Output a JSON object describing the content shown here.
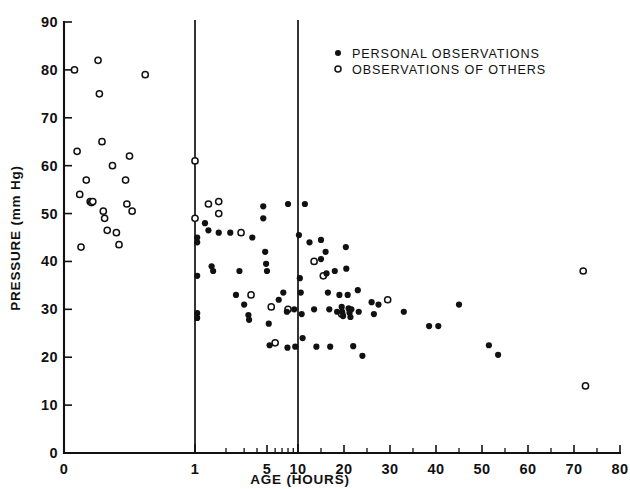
{
  "chart_data": {
    "type": "scatter",
    "title": "",
    "xlabel": "AGE (HOURS)",
    "ylabel": "PRESSURE (mm Hg)",
    "xlim": [
      0,
      80
    ],
    "ylim": [
      0,
      90
    ],
    "grid": false,
    "x_scale": "piecewise (0-1 linear expanded, 1-10 log, 10-80 linear)",
    "xticks": [
      0,
      1,
      5,
      10,
      20,
      30,
      40,
      50,
      60,
      70,
      80
    ],
    "xtick_labels": [
      "0",
      "1",
      "5",
      "10",
      "20",
      "30",
      "40",
      "50",
      "60",
      "70",
      "80"
    ],
    "yticks": [
      0,
      10,
      20,
      30,
      40,
      50,
      60,
      70,
      80,
      90
    ],
    "ytick_labels": [
      "0",
      "10",
      "20",
      "30",
      "40",
      "50",
      "60",
      "70",
      "80",
      "90"
    ],
    "vertical_reference_lines": [
      1,
      10
    ],
    "legend": {
      "position": "top-right",
      "entries": [
        {
          "label": "PERSONAL OBSERVATIONS",
          "marker": "filled-circle"
        },
        {
          "label": "OBSERVATIONS OF OTHERS",
          "marker": "open-circle"
        }
      ]
    },
    "series": [
      {
        "name": "PERSONAL OBSERVATIONS",
        "marker": "filled-circle",
        "color": "#111111",
        "points": [
          [
            1.05,
            45.0
          ],
          [
            1.05,
            44.0
          ],
          [
            1.05,
            37.0
          ],
          [
            1.05,
            29.2
          ],
          [
            1.05,
            28.2
          ],
          [
            1.25,
            48.0
          ],
          [
            1.35,
            46.5
          ],
          [
            1.45,
            39.0
          ],
          [
            1.5,
            38.0
          ],
          [
            1.7,
            46.0
          ],
          [
            2.2,
            46.0
          ],
          [
            2.5,
            33.0
          ],
          [
            2.7,
            38.0
          ],
          [
            3.0,
            31.0
          ],
          [
            3.3,
            28.8
          ],
          [
            3.35,
            27.8
          ],
          [
            3.6,
            45.0
          ],
          [
            4.6,
            51.5
          ],
          [
            4.6,
            49.0
          ],
          [
            4.8,
            42.0
          ],
          [
            4.9,
            39.5
          ],
          [
            5.0,
            38.0
          ],
          [
            5.2,
            27.0
          ],
          [
            5.3,
            22.5
          ],
          [
            6.5,
            32.0
          ],
          [
            7.2,
            33.5
          ],
          [
            7.8,
            29.5
          ],
          [
            7.9,
            22.0
          ],
          [
            8.0,
            52.0
          ],
          [
            9.2,
            30.0
          ],
          [
            9.4,
            22.2
          ],
          [
            10.2,
            45.5
          ],
          [
            10.4,
            36.5
          ],
          [
            10.6,
            33.5
          ],
          [
            10.8,
            29.0
          ],
          [
            11.0,
            24.0
          ],
          [
            11.5,
            52.0
          ],
          [
            12.5,
            44.0
          ],
          [
            13.5,
            30.0
          ],
          [
            14.0,
            22.2
          ],
          [
            15.0,
            44.5
          ],
          [
            15.0,
            40.5
          ],
          [
            16.0,
            42.0
          ],
          [
            16.2,
            37.5
          ],
          [
            16.5,
            33.5
          ],
          [
            16.8,
            30.0
          ],
          [
            17.0,
            22.2
          ],
          [
            18.0,
            38.0
          ],
          [
            18.5,
            29.5
          ],
          [
            19.0,
            33.0
          ],
          [
            19.5,
            30.5
          ],
          [
            19.6,
            29.5
          ],
          [
            19.8,
            28.6
          ],
          [
            20.4,
            43.0
          ],
          [
            20.5,
            38.5
          ],
          [
            20.8,
            33.0
          ],
          [
            21.0,
            30.2
          ],
          [
            21.2,
            29.3
          ],
          [
            21.4,
            28.4
          ],
          [
            21.6,
            30.0
          ],
          [
            22.0,
            22.3
          ],
          [
            23.0,
            34.0
          ],
          [
            23.2,
            29.5
          ],
          [
            24.0,
            20.3
          ],
          [
            26.0,
            31.5
          ],
          [
            26.5,
            29.0
          ],
          [
            27.5,
            31.0
          ],
          [
            33.0,
            29.5
          ],
          [
            38.5,
            26.5
          ],
          [
            40.5,
            26.5
          ],
          [
            45.0,
            31.0
          ],
          [
            51.5,
            22.5
          ],
          [
            53.5,
            20.5
          ]
        ]
      },
      {
        "name": "OBSERVATIONS OF OTHERS",
        "marker": "open-circle",
        "color": "#111111",
        "points": [
          [
            0.08,
            80.0
          ],
          [
            0.1,
            63.0
          ],
          [
            0.12,
            54.0
          ],
          [
            0.13,
            43.0
          ],
          [
            0.17,
            57.0
          ],
          [
            0.2,
            52.5
          ],
          [
            0.21,
            52.3
          ],
          [
            0.22,
            52.5
          ],
          [
            0.26,
            82.0
          ],
          [
            0.27,
            75.0
          ],
          [
            0.29,
            65.0
          ],
          [
            0.3,
            50.5
          ],
          [
            0.31,
            49.0
          ],
          [
            0.33,
            46.5
          ],
          [
            0.37,
            60.0
          ],
          [
            0.4,
            46.0
          ],
          [
            0.42,
            43.5
          ],
          [
            0.47,
            57.0
          ],
          [
            0.48,
            52.0
          ],
          [
            0.5,
            62.0
          ],
          [
            0.52,
            50.5
          ],
          [
            0.62,
            79.0
          ],
          [
            1.0,
            61.0
          ],
          [
            1.0,
            49.0
          ],
          [
            1.35,
            52.0
          ],
          [
            1.7,
            52.5
          ],
          [
            1.7,
            50.0
          ],
          [
            2.8,
            46.0
          ],
          [
            3.5,
            33.0
          ],
          [
            5.5,
            30.5
          ],
          [
            6.0,
            23.0
          ],
          [
            8.0,
            30.0
          ],
          [
            13.5,
            40.0
          ],
          [
            15.5,
            37.0
          ],
          [
            19.5,
            29.0
          ],
          [
            29.5,
            32.0
          ],
          [
            72.0,
            38.0
          ],
          [
            72.5,
            14.0
          ]
        ]
      }
    ]
  },
  "axis": {
    "x_title": "AGE (HOURS)",
    "y_title": "PRESSURE (mm Hg)"
  },
  "legend": {
    "entry1": "PERSONAL OBSERVATIONS",
    "entry2": "OBSERVATIONS OF OTHERS"
  },
  "colors": {
    "ink": "#111111",
    "background": "#ffffff"
  }
}
